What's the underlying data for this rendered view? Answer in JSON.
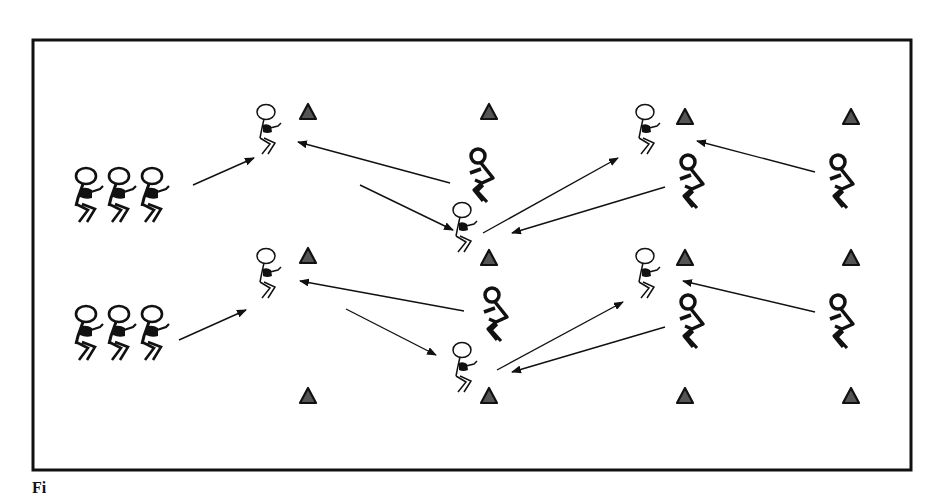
{
  "diagram": {
    "field": {
      "x": 33,
      "y": 40,
      "width": 878,
      "height": 430,
      "stroke": "#111111"
    },
    "colors": {
      "ink": "#111111",
      "cone_fill": "#555555",
      "cone_stroke": "#111111",
      "background": "#ffffff"
    },
    "groups": [
      {
        "name": "waiting-line-top",
        "x": 72,
        "y": 168,
        "count": 3,
        "spacing": 33
      },
      {
        "name": "waiting-line-bottom",
        "x": 72,
        "y": 306,
        "count": 3,
        "spacing": 33
      }
    ],
    "receivers": [
      {
        "name": "receiver-top-1",
        "x": 266,
        "y": 112
      },
      {
        "name": "receiver-bottom-1",
        "x": 266,
        "y": 256
      },
      {
        "name": "receiver-top-2",
        "x": 462,
        "y": 210
      },
      {
        "name": "receiver-bottom-2",
        "x": 462,
        "y": 350
      },
      {
        "name": "receiver-top-3",
        "x": 645,
        "y": 112
      },
      {
        "name": "receiver-bottom-3",
        "x": 645,
        "y": 256
      }
    ],
    "defenders": [
      {
        "name": "defender-top-1",
        "x": 478,
        "y": 156
      },
      {
        "name": "defender-bottom-1",
        "x": 492,
        "y": 295
      },
      {
        "name": "defender-top-2",
        "x": 688,
        "y": 162
      },
      {
        "name": "defender-bottom-2",
        "x": 688,
        "y": 302
      },
      {
        "name": "defender-top-3",
        "x": 838,
        "y": 162
      },
      {
        "name": "defender-bottom-3",
        "x": 838,
        "y": 302
      }
    ],
    "cones": [
      {
        "x": 308,
        "y": 113
      },
      {
        "x": 489,
        "y": 113
      },
      {
        "x": 685,
        "y": 118
      },
      {
        "x": 851,
        "y": 118
      },
      {
        "x": 489,
        "y": 259
      },
      {
        "x": 308,
        "y": 257
      },
      {
        "x": 685,
        "y": 259
      },
      {
        "x": 851,
        "y": 259
      },
      {
        "x": 308,
        "y": 397
      },
      {
        "x": 489,
        "y": 397
      },
      {
        "x": 685,
        "y": 397
      },
      {
        "x": 851,
        "y": 397
      }
    ],
    "arrows": [
      {
        "x1": 193,
        "y1": 185,
        "x2": 254,
        "y2": 158
      },
      {
        "x1": 450,
        "y1": 183,
        "x2": 298,
        "y2": 142
      },
      {
        "x1": 360,
        "y1": 185,
        "x2": 453,
        "y2": 230
      },
      {
        "x1": 483,
        "y1": 233,
        "x2": 618,
        "y2": 158
      },
      {
        "x1": 665,
        "y1": 187,
        "x2": 512,
        "y2": 233
      },
      {
        "x1": 815,
        "y1": 172,
        "x2": 697,
        "y2": 141
      },
      {
        "x1": 179,
        "y1": 340,
        "x2": 246,
        "y2": 310
      },
      {
        "x1": 464,
        "y1": 311,
        "x2": 300,
        "y2": 281
      },
      {
        "x1": 346,
        "y1": 309,
        "x2": 436,
        "y2": 355
      },
      {
        "x1": 497,
        "y1": 370,
        "x2": 623,
        "y2": 302
      },
      {
        "x1": 665,
        "y1": 327,
        "x2": 512,
        "y2": 372
      },
      {
        "x1": 815,
        "y1": 312,
        "x2": 683,
        "y2": 281
      }
    ]
  },
  "caption": {
    "text": "Fi"
  }
}
